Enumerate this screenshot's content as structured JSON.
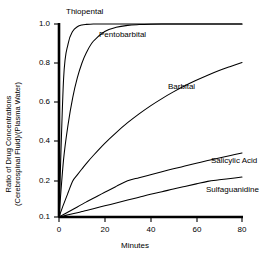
{
  "chart_data": {
    "type": "line",
    "title": "",
    "xlabel": "Minutes",
    "ylabel_line1": "Ratio of Drug Concentrations",
    "ylabel_line2": "(Cerebrospinal Fluid)/(Plasma Water)",
    "xlim": [
      0,
      80
    ],
    "ylim": [
      0.1,
      1.0
    ],
    "xticks": [
      0,
      20,
      40,
      60,
      80
    ],
    "xtick_labels": [
      "0",
      "20",
      "40",
      "60",
      "80"
    ],
    "yticks": [
      0.1,
      0.2,
      0.4,
      0.6,
      0.8,
      1.0
    ],
    "ytick_labels": [
      "0.1",
      "0.2",
      "0.4",
      "0.6",
      "0.8",
      "1.0"
    ],
    "grid": false,
    "legend": "inline-annotations",
    "line_color": "#000000",
    "axis_color": "#000000",
    "x": [
      0,
      2,
      4,
      6,
      8,
      10,
      12,
      15,
      20,
      25,
      30,
      35,
      40,
      45,
      50,
      55,
      60,
      65,
      70,
      75,
      80
    ],
    "series": [
      {
        "name": "Thiopental",
        "label": "Thiopental",
        "values": [
          0.1,
          0.72,
          0.9,
          0.963,
          0.986,
          0.995,
          0.998,
          1.0,
          1.0,
          1.0,
          1.0,
          1.0,
          1.0,
          1.0,
          1.0,
          1.0,
          1.0,
          1.0,
          1.0,
          1.0,
          1.0
        ]
      },
      {
        "name": "Pentobarbital",
        "label": "Pentobarbital",
        "values": [
          0.1,
          0.31,
          0.49,
          0.625,
          0.725,
          0.8,
          0.855,
          0.912,
          0.962,
          0.983,
          0.993,
          0.997,
          0.999,
          1.0,
          1.0,
          1.0,
          1.0,
          1.0,
          1.0,
          1.0,
          1.0
        ]
      },
      {
        "name": "Barbital",
        "label": "Barbital",
        "values": [
          0.1,
          0.135,
          0.168,
          0.2,
          0.231,
          0.261,
          0.29,
          0.33,
          0.392,
          0.447,
          0.497,
          0.542,
          0.583,
          0.62,
          0.654,
          0.685,
          0.713,
          0.739,
          0.763,
          0.784,
          0.804
        ]
      },
      {
        "name": "Salicylic Acid",
        "label": "Salicylic Acid",
        "values": [
          0.1,
          0.107,
          0.114,
          0.121,
          0.128,
          0.135,
          0.142,
          0.152,
          0.169,
          0.185,
          0.201,
          0.217,
          0.232,
          0.247,
          0.262,
          0.276,
          0.29,
          0.304,
          0.317,
          0.33,
          0.343
        ]
      },
      {
        "name": "Sulfaguanidine",
        "label": "Sulfaguanidine",
        "values": [
          0.1,
          0.103,
          0.106,
          0.109,
          0.112,
          0.115,
          0.118,
          0.123,
          0.131,
          0.139,
          0.147,
          0.155,
          0.163,
          0.17,
          0.178,
          0.185,
          0.192,
          0.199,
          0.206,
          0.213,
          0.22
        ]
      }
    ],
    "annotations": [
      {
        "text": "Thiopental",
        "x_px": 66,
        "y_px": 8
      },
      {
        "text": "Pentobarbital",
        "x_px": 99,
        "y_px": 31
      },
      {
        "text": "Barbital",
        "x_px": 168,
        "y_px": 83
      },
      {
        "text": "Salicylic Acid",
        "x_px": 211,
        "y_px": 157
      },
      {
        "text": "Sulfaguanidine",
        "x_px": 206,
        "y_px": 186
      }
    ]
  }
}
